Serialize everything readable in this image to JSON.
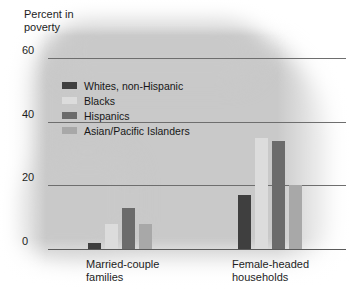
{
  "chart_data": {
    "type": "bar",
    "title": "",
    "ylabel": "Percent in\npoverty",
    "xlabel": "",
    "categories": [
      "Married-couple\nfamilies",
      "Female-headed\nhouseholds"
    ],
    "series": [
      {
        "name": "Whites, non-Hispanic",
        "color": "#3f3f3f",
        "values": [
          2,
          17
        ]
      },
      {
        "name": "Blacks",
        "color": "#dcdcdc",
        "values": [
          8,
          35
        ]
      },
      {
        "name": "Hispanics",
        "color": "#6b6b6b",
        "values": [
          13,
          34
        ]
      },
      {
        "name": "Asian/Pacific Islanders",
        "color": "#a8a8a8",
        "values": [
          8,
          20
        ]
      }
    ],
    "ylim": [
      0,
      60
    ],
    "yticks": [
      "0",
      "20",
      "40",
      "60"
    ],
    "grid": true,
    "legend_position": "upper-left-inside"
  },
  "axis": {
    "y_title": "Percent in\npoverty",
    "ticks": [
      {
        "label": "60"
      },
      {
        "label": "40"
      },
      {
        "label": "20"
      },
      {
        "label": "0"
      }
    ]
  },
  "legend": {
    "items": [
      {
        "label": "Whites, non-Hispanic"
      },
      {
        "label": "Blacks"
      },
      {
        "label": "Hispanics"
      },
      {
        "label": "Asian/Pacific Islanders"
      }
    ]
  },
  "groups": [
    {
      "label": "Married-couple\nfamilies"
    },
    {
      "label": "Female-headed\nhouseholds"
    }
  ]
}
